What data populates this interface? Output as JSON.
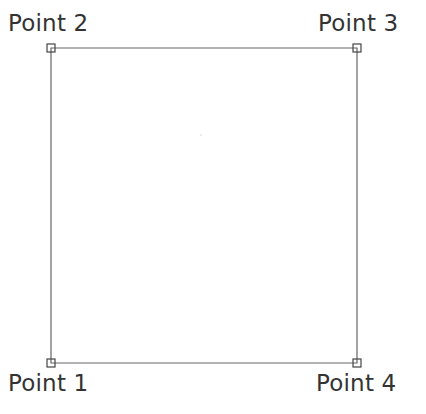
{
  "diagram": {
    "type": "rectangle-with-labeled-corners",
    "stroke_color": "#555555",
    "points": [
      {
        "id": "p1",
        "label": "Point 1",
        "x": 51,
        "y": 363,
        "label_x": 8,
        "label_y": 372
      },
      {
        "id": "p2",
        "label": "Point 2",
        "x": 51,
        "y": 48,
        "label_x": 8,
        "label_y": 12
      },
      {
        "id": "p3",
        "label": "Point 3",
        "x": 357,
        "y": 48,
        "label_x": 318,
        "label_y": 12
      },
      {
        "id": "p4",
        "label": "Point 4",
        "x": 357,
        "y": 363,
        "label_x": 316,
        "label_y": 372
      }
    ],
    "center_mark": {
      "x": 201,
      "y": 135
    }
  }
}
